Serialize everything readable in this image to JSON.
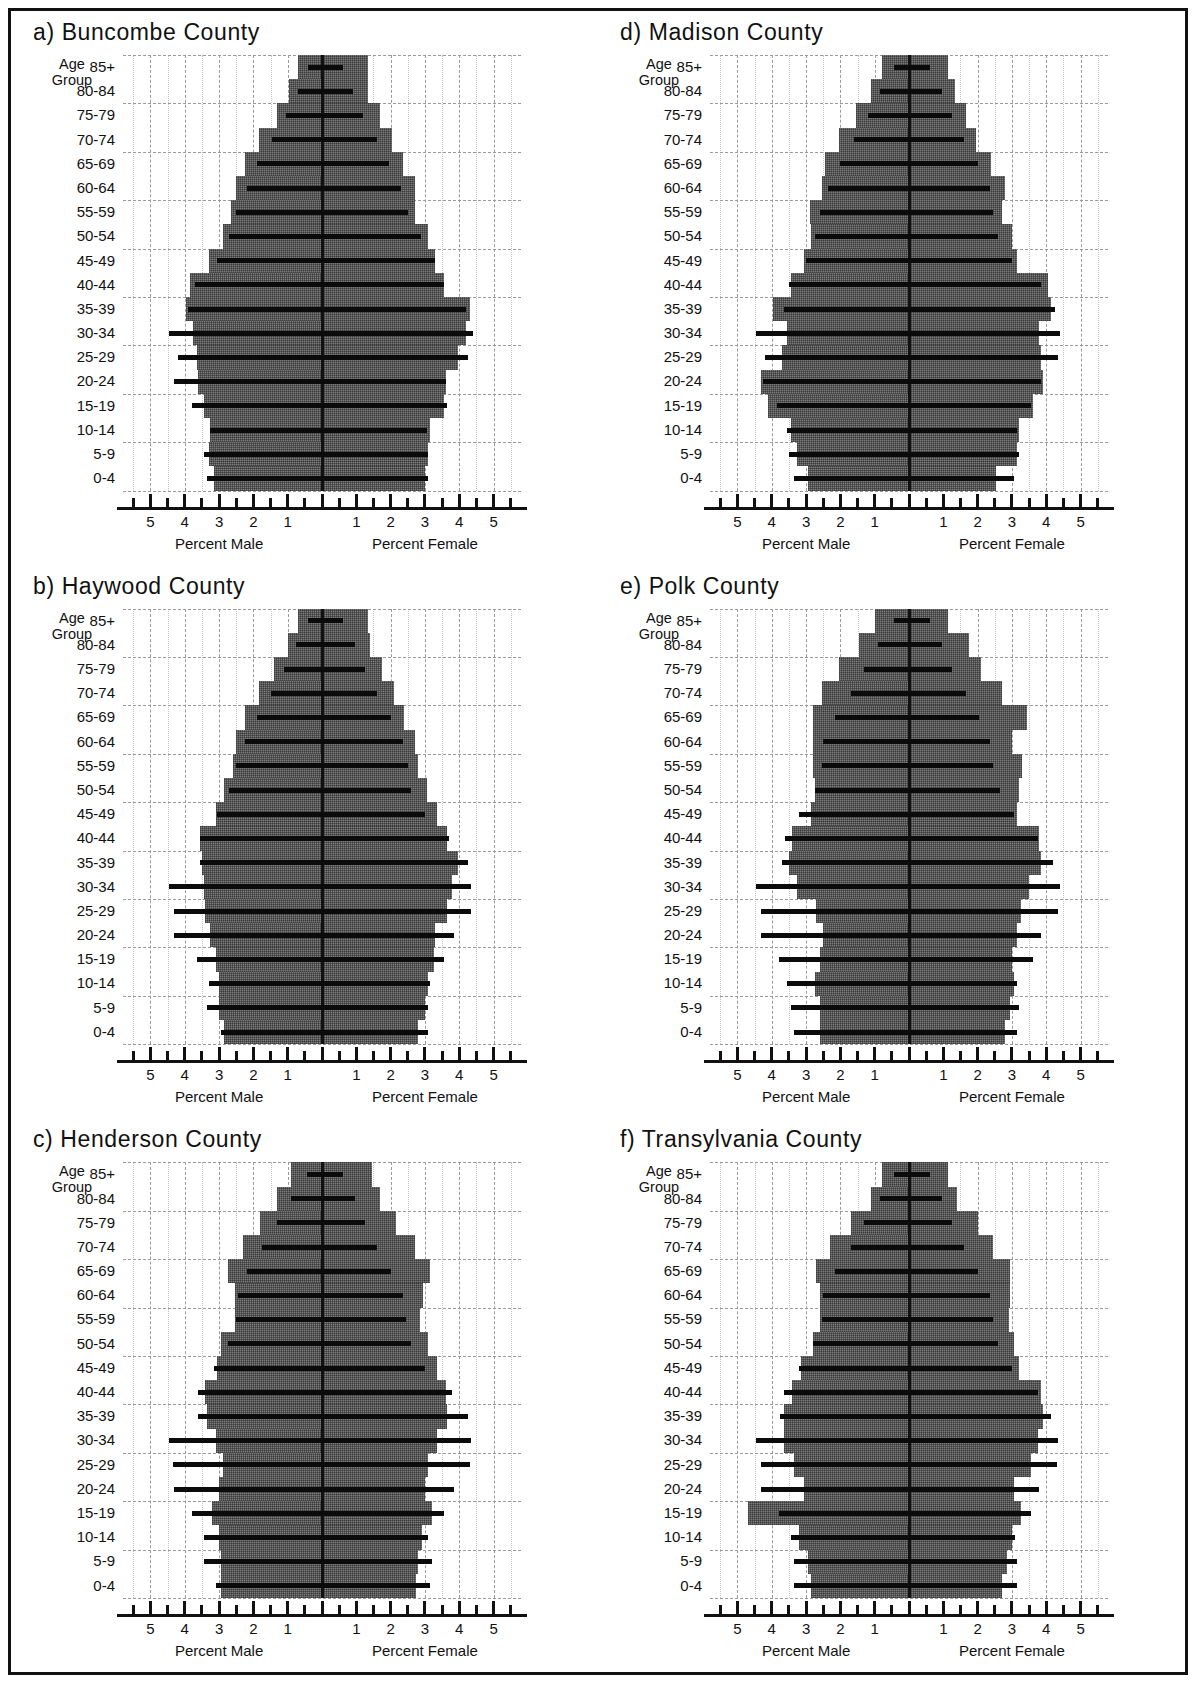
{
  "figure": {
    "age_group_label_line1": "Age",
    "age_group_label_line2": "Group",
    "male_caption": "Percent Male",
    "female_caption": "Percent Female",
    "fill_color": "#7b7b7b",
    "reference_bar_color": "#0b0b0b",
    "axis_color": "#111111",
    "grid_color": "#9a9a9a"
  },
  "chart_data": {
    "type": "bar",
    "subtype": "population-pyramid",
    "xlabel_left": "Percent Male",
    "xlabel_right": "Percent Female",
    "ylabel": "Age Group",
    "xlim": [
      -5.8,
      5.8
    ],
    "xticks_labeled": [
      5,
      4,
      3,
      2,
      1,
      1,
      2,
      3,
      4,
      5
    ],
    "xtick_step_minor": 0.5,
    "grid": true,
    "legend": null,
    "categories": [
      "0-4",
      "5-9",
      "10-14",
      "15-19",
      "20-24",
      "25-29",
      "30-34",
      "35-39",
      "40-44",
      "45-49",
      "50-54",
      "55-59",
      "60-64",
      "65-69",
      "70-74",
      "75-79",
      "80-84",
      "85+"
    ],
    "panels": [
      {
        "key": "a",
        "label": "a) Buncombe County",
        "county": "Buncombe County",
        "series": [
          {
            "name": "Male (shaded)",
            "values": [
              -3.15,
              -3.3,
              -3.25,
              -3.45,
              -3.6,
              -3.65,
              -3.75,
              -3.95,
              -3.85,
              -3.3,
              -2.9,
              -2.65,
              -2.5,
              -2.25,
              -1.85,
              -1.3,
              -0.95,
              -0.7
            ]
          },
          {
            "name": "Female (shaded)",
            "values": [
              3.0,
              3.1,
              3.15,
              3.55,
              3.6,
              3.95,
              4.2,
              4.3,
              3.55,
              3.3,
              3.1,
              2.7,
              2.7,
              2.35,
              2.05,
              1.7,
              1.35,
              1.35
            ]
          },
          {
            "name": "Male (reference line)",
            "values": [
              -3.35,
              -3.45,
              -3.25,
              -3.8,
              -4.3,
              -4.2,
              -4.45,
              -3.9,
              -3.7,
              -3.05,
              -2.7,
              -2.5,
              -2.2,
              -1.9,
              -1.45,
              -1.05,
              -0.7,
              -0.4
            ]
          },
          {
            "name": "Female (reference line)",
            "values": [
              3.1,
              3.1,
              3.05,
              3.65,
              3.6,
              4.25,
              4.4,
              4.2,
              3.55,
              3.3,
              2.9,
              2.5,
              2.3,
              1.95,
              1.6,
              1.2,
              0.9,
              0.6
            ]
          }
        ]
      },
      {
        "key": "b",
        "label": "b) Haywood County",
        "county": "Haywood County",
        "series": [
          {
            "name": "Male (shaded)",
            "values": [
              -2.85,
              -3.0,
              -3.0,
              -3.1,
              -3.25,
              -3.4,
              -3.45,
              -3.5,
              -3.55,
              -3.1,
              -2.85,
              -2.6,
              -2.5,
              -2.25,
              -1.85,
              -1.4,
              -1.0,
              -0.7
            ]
          },
          {
            "name": "Female (shaded)",
            "values": [
              2.8,
              3.0,
              3.1,
              3.25,
              3.3,
              3.65,
              3.8,
              3.95,
              3.65,
              3.35,
              3.05,
              2.8,
              2.7,
              2.4,
              2.1,
              1.75,
              1.4,
              1.35
            ]
          },
          {
            "name": "Male (reference line)",
            "values": [
              -2.95,
              -3.35,
              -3.3,
              -3.65,
              -4.3,
              -4.3,
              -4.45,
              -3.55,
              -3.55,
              -3.05,
              -2.7,
              -2.5,
              -2.25,
              -1.9,
              -1.5,
              -1.1,
              -0.75,
              -0.4
            ]
          },
          {
            "name": "Female (reference line)",
            "values": [
              3.1,
              3.1,
              3.15,
              3.55,
              3.85,
              4.35,
              4.35,
              4.25,
              3.7,
              3.0,
              2.6,
              2.5,
              2.35,
              2.0,
              1.6,
              1.25,
              0.95,
              0.6
            ]
          }
        ]
      },
      {
        "key": "c",
        "label": "c) Henderson County",
        "county": "Henderson County",
        "series": [
          {
            "name": "Male (shaded)",
            "values": [
              -2.95,
              -2.95,
              -3.0,
              -3.2,
              -3.0,
              -2.9,
              -3.1,
              -3.35,
              -3.4,
              -3.05,
              -2.95,
              -2.55,
              -2.55,
              -2.75,
              -2.3,
              -1.8,
              -1.3,
              -0.9
            ]
          },
          {
            "name": "Female (shaded)",
            "values": [
              2.75,
              2.8,
              2.9,
              3.2,
              3.0,
              3.1,
              3.35,
              3.65,
              3.6,
              3.35,
              3.1,
              2.85,
              2.95,
              3.15,
              2.7,
              2.15,
              1.7,
              1.45
            ]
          },
          {
            "name": "Male (reference line)",
            "values": [
              -3.1,
              -3.45,
              -3.45,
              -3.8,
              -4.3,
              -4.35,
              -4.45,
              -3.6,
              -3.6,
              -3.15,
              -2.75,
              -2.5,
              -2.45,
              -2.2,
              -1.75,
              -1.3,
              -0.9,
              -0.45
            ]
          },
          {
            "name": "Female (reference line)",
            "values": [
              3.15,
              3.2,
              3.1,
              3.55,
              3.85,
              4.3,
              4.35,
              4.25,
              3.8,
              3.0,
              2.6,
              2.45,
              2.35,
              2.0,
              1.6,
              1.25,
              0.95,
              0.6
            ]
          }
        ]
      },
      {
        "key": "d",
        "label": "d) Madison County",
        "county": "Madison County",
        "series": [
          {
            "name": "Male (shaded)",
            "values": [
              -2.95,
              -3.25,
              -3.45,
              -4.1,
              -4.3,
              -3.7,
              -3.55,
              -3.95,
              -3.45,
              -3.05,
              -2.85,
              -2.9,
              -2.55,
              -2.45,
              -2.05,
              -1.55,
              -1.1,
              -0.8
            ]
          },
          {
            "name": "Female (shaded)",
            "values": [
              2.55,
              3.15,
              3.2,
              3.6,
              3.9,
              3.85,
              3.8,
              4.15,
              4.05,
              3.15,
              3.0,
              2.7,
              2.8,
              2.4,
              1.95,
              1.65,
              1.35,
              1.15
            ]
          },
          {
            "name": "Male (reference line)",
            "values": [
              -3.35,
              -3.5,
              -3.55,
              -3.85,
              -4.25,
              -4.2,
              -4.45,
              -3.65,
              -3.5,
              -3.0,
              -2.75,
              -2.6,
              -2.35,
              -2.0,
              -1.6,
              -1.2,
              -0.85,
              -0.45
            ]
          },
          {
            "name": "Female (reference line)",
            "values": [
              3.05,
              3.2,
              3.15,
              3.55,
              3.85,
              4.35,
              4.4,
              4.25,
              3.85,
              3.0,
              2.6,
              2.45,
              2.35,
              2.0,
              1.6,
              1.25,
              0.95,
              0.6
            ]
          }
        ]
      },
      {
        "key": "e",
        "label": "e) Polk County",
        "county": "Polk County",
        "series": [
          {
            "name": "Male (shaded)",
            "values": [
              -2.6,
              -2.6,
              -2.75,
              -2.6,
              -2.5,
              -2.7,
              -3.25,
              -3.5,
              -3.4,
              -2.85,
              -2.75,
              -2.8,
              -2.8,
              -2.8,
              -2.55,
              -2.05,
              -1.45,
              -1.0
            ]
          },
          {
            "name": "Female (shaded)",
            "values": [
              2.8,
              2.95,
              3.05,
              3.0,
              3.15,
              3.25,
              3.5,
              3.85,
              3.8,
              3.15,
              3.2,
              3.3,
              3.0,
              3.45,
              2.7,
              2.1,
              1.75,
              1.15
            ]
          },
          {
            "name": "Male (reference line)",
            "values": [
              -3.35,
              -3.45,
              -3.55,
              -3.8,
              -4.3,
              -4.3,
              -4.45,
              -3.7,
              -3.6,
              -3.2,
              -2.75,
              -2.55,
              -2.5,
              -2.15,
              -1.7,
              -1.3,
              -0.9,
              -0.45
            ]
          },
          {
            "name": "Female (reference line)",
            "values": [
              3.15,
              3.2,
              3.15,
              3.6,
              3.85,
              4.35,
              4.4,
              4.2,
              3.75,
              3.05,
              2.65,
              2.45,
              2.35,
              2.05,
              1.65,
              1.25,
              0.95,
              0.6
            ]
          }
        ]
      },
      {
        "key": "f",
        "label": "f) Transylvania County",
        "county": "Transylvania County",
        "series": [
          {
            "name": "Male (shaded)",
            "values": [
              -2.85,
              -2.95,
              -3.2,
              -4.7,
              -3.05,
              -3.35,
              -3.65,
              -3.65,
              -3.4,
              -3.15,
              -2.8,
              -2.6,
              -2.6,
              -2.7,
              -2.3,
              -1.7,
              -1.1,
              -0.8
            ]
          },
          {
            "name": "Female (shaded)",
            "values": [
              2.7,
              2.85,
              3.0,
              3.25,
              3.05,
              3.55,
              3.75,
              3.9,
              3.85,
              3.2,
              3.05,
              2.9,
              2.95,
              2.95,
              2.45,
              2.0,
              1.4,
              1.15
            ]
          },
          {
            "name": "Male (reference line)",
            "values": [
              -3.35,
              -3.35,
              -3.45,
              -3.8,
              -4.3,
              -4.3,
              -4.45,
              -3.75,
              -3.65,
              -3.2,
              -2.8,
              -2.55,
              -2.5,
              -2.15,
              -1.7,
              -1.3,
              -0.85,
              -0.45
            ]
          },
          {
            "name": "Female (reference line)",
            "values": [
              3.15,
              3.15,
              3.1,
              3.55,
              3.8,
              4.3,
              4.35,
              4.15,
              3.75,
              3.0,
              2.6,
              2.45,
              2.35,
              2.0,
              1.6,
              1.25,
              0.95,
              0.6
            ]
          }
        ]
      }
    ]
  }
}
